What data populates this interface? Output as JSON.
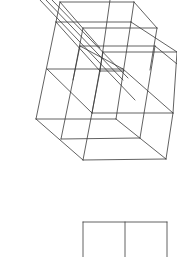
{
  "figure": {
    "stroke_color": "#3a3a3a",
    "background": "#ffffff",
    "lines": [
      [
        60,
        2,
        134,
        2
      ],
      [
        56,
        22,
        131,
        22
      ],
      [
        83,
        28,
        157,
        28
      ],
      [
        80,
        46,
        155,
        46
      ],
      [
        103,
        52,
        177,
        52
      ],
      [
        47,
        69,
        123,
        69
      ],
      [
        100,
        71,
        124,
        71
      ],
      [
        92,
        113,
        173,
        113
      ],
      [
        36,
        119,
        116,
        119
      ],
      [
        61,
        139,
        140,
        138
      ],
      [
        83,
        160,
        166,
        159
      ],
      [
        40,
        0,
        135,
        100
      ],
      [
        46,
        0,
        123,
        80
      ],
      [
        52,
        0,
        128,
        78
      ],
      [
        60,
        2,
        100,
        48
      ],
      [
        134,
        2,
        157,
        28
      ],
      [
        131,
        22,
        177,
        52
      ],
      [
        56,
        22,
        100,
        71
      ],
      [
        80,
        46,
        123,
        69
      ],
      [
        155,
        46,
        177,
        64
      ],
      [
        47,
        69,
        92,
        113
      ],
      [
        123,
        69,
        173,
        113
      ],
      [
        36,
        119,
        83,
        160
      ],
      [
        116,
        119,
        166,
        159
      ],
      [
        56,
        22,
        36,
        119
      ],
      [
        60,
        2,
        56,
        22
      ],
      [
        83,
        28,
        73,
        80
      ],
      [
        80,
        46,
        61,
        139
      ],
      [
        110,
        0,
        100,
        71
      ],
      [
        103,
        52,
        92,
        113
      ],
      [
        100,
        71,
        83,
        160
      ],
      [
        134,
        2,
        131,
        22
      ],
      [
        157,
        28,
        150,
        70
      ],
      [
        155,
        46,
        140,
        138
      ],
      [
        177,
        52,
        173,
        113
      ],
      [
        173,
        113,
        166,
        159
      ],
      [
        131,
        22,
        116,
        119
      ],
      [
        83,
        222,
        167,
        222
      ],
      [
        83,
        222,
        83,
        257
      ],
      [
        125,
        222,
        125,
        257
      ],
      [
        167,
        222,
        167,
        257
      ]
    ]
  }
}
